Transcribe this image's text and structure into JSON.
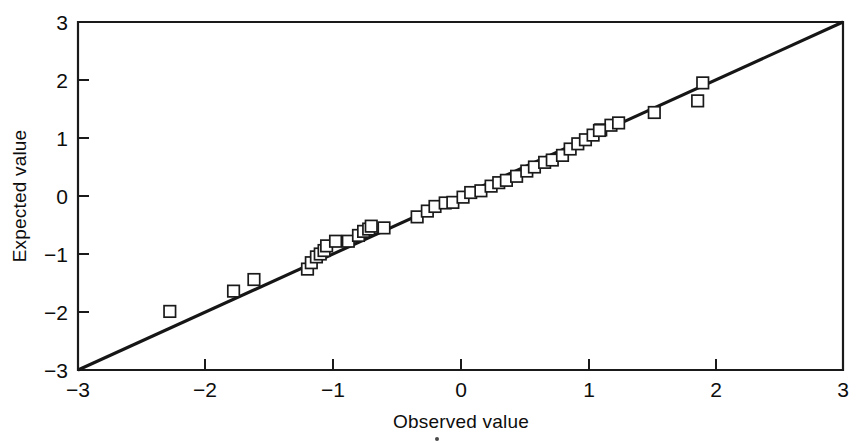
{
  "chart_data": {
    "type": "scatter",
    "title": "",
    "subtitle": "",
    "xlabel": "Observed value",
    "ylabel": "Expected value",
    "xlim": [
      -3,
      3
    ],
    "ylim": [
      -3,
      3
    ],
    "xticks": [
      -3,
      -2,
      -1,
      0,
      1,
      2,
      3
    ],
    "yticks": [
      -3,
      -2,
      -1,
      0,
      1,
      2,
      3
    ],
    "xtick_labels": [
      "−3",
      "−2",
      "−1",
      "0",
      "1",
      "2",
      "3"
    ],
    "ytick_labels": [
      "−3",
      "−2",
      "−1",
      "0",
      "1",
      "2",
      "3"
    ],
    "grid": false,
    "legend": null,
    "marker_style": "open-square",
    "marker_color": "#1a1a1a",
    "line_color": "#161616",
    "background_color": "#ffffff",
    "annotations": [],
    "reference_line": {
      "name": "identity-line",
      "from": [
        -3,
        -3
      ],
      "to": [
        3,
        3
      ],
      "slope": 1,
      "intercept": 0
    },
    "series": [
      {
        "name": "Normal Q-Q points",
        "x": [
          -2.28,
          -1.78,
          -1.62,
          -1.2,
          -1.17,
          -1.13,
          -1.1,
          -1.07,
          -1.05,
          -0.98,
          -0.88,
          -0.8,
          -0.76,
          -0.72,
          -0.7,
          -0.6,
          -0.34,
          -0.26,
          -0.2,
          -0.12,
          -0.06,
          0.02,
          0.08,
          0.16,
          0.24,
          0.3,
          0.36,
          0.44,
          0.52,
          0.58,
          0.66,
          0.72,
          0.8,
          0.86,
          0.92,
          0.98,
          1.04,
          1.1,
          1.18,
          1.24,
          1.52,
          1.86
        ],
        "y": [
          -1.99,
          -1.64,
          -1.44,
          -1.26,
          -1.15,
          -1.05,
          -1.0,
          -0.94,
          -0.86,
          -0.78,
          -0.78,
          -0.68,
          -0.61,
          -0.57,
          -0.52,
          -0.55,
          -0.36,
          -0.26,
          -0.18,
          -0.12,
          -0.11,
          -0.02,
          0.06,
          0.09,
          0.17,
          0.23,
          0.27,
          0.34,
          0.43,
          0.5,
          0.58,
          0.62,
          0.7,
          0.81,
          0.9,
          0.97,
          1.05,
          1.14,
          1.22,
          1.26,
          1.44,
          1.64
        ],
        "count": 42
      }
    ],
    "extra_points": [
      {
        "name": "high-point-1",
        "x": 1.09,
        "y": 1.13
      },
      {
        "name": "high-point-2",
        "x": 1.9,
        "y": 1.95
      }
    ]
  },
  "figure": {
    "axis_titles": {
      "x": "Observed value",
      "y": "Expected value"
    }
  }
}
